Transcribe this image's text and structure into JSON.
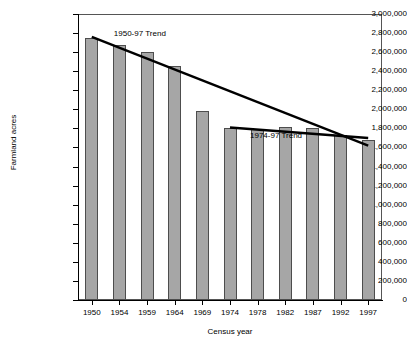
{
  "chart_data": {
    "type": "bar",
    "title": "",
    "xlabel": "Census year",
    "ylabel": "Farmland acres",
    "categories": [
      "1950",
      "1954",
      "1959",
      "1964",
      "1969",
      "1974",
      "1978",
      "1982",
      "1987",
      "1992",
      "1997"
    ],
    "values": [
      2750000,
      2680000,
      2600000,
      2450000,
      1980000,
      1800000,
      1790000,
      1810000,
      1800000,
      1730000,
      1680000
    ],
    "ylim": [
      0,
      3000000
    ],
    "ytick_labels": [
      "0",
      "200,000",
      "400,000",
      "600,000",
      "800,000",
      "1,000,000",
      "1,200,000",
      "1,400,000",
      "1,600,000",
      "1,800,000",
      "2,000,000",
      "2,200,000",
      "2,400,000",
      "2,600,000",
      "2,800,000",
      "3,000,000"
    ],
    "ytick_values": [
      0,
      200000,
      400000,
      600000,
      800000,
      1000000,
      1200000,
      1400000,
      1600000,
      1800000,
      2000000,
      2200000,
      2400000,
      2600000,
      2800000,
      3000000
    ],
    "grid": false,
    "legend_position": "none",
    "bar_fill_color": "#a6a6a6",
    "bar_border_color": "#4d4d4d",
    "trend_color": "#000000",
    "annotations": [
      {
        "label": "1950-97 Trend",
        "start_category": "1950",
        "start_value": 2760000,
        "end_category": "1997",
        "end_value": 1620000
      },
      {
        "label": "1974-97 Trend",
        "start_category": "1974",
        "start_value": 1810000,
        "end_category": "1997",
        "end_value": 1700000
      }
    ]
  }
}
